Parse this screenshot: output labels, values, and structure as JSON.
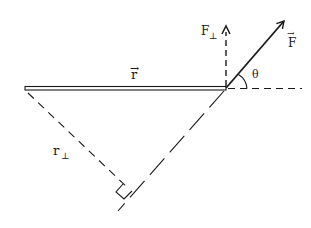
{
  "diagram": {
    "labels": {
      "r_vector": "r",
      "r_vector_arrow": "→",
      "r_perp": "r",
      "r_perp_sub": "⊥",
      "F_vector": "F",
      "F_vector_arrow": "→",
      "F_perp": "F",
      "F_perp_sub": "⊥",
      "theta": "θ"
    },
    "colors": {
      "ink": "#1a1a1a",
      "background": "#ffffff"
    },
    "geometry": {
      "rod": {
        "x1": 25,
        "y1": 88,
        "x2": 226,
        "y2": 88
      },
      "pivot": {
        "x": 226,
        "y": 88
      },
      "force_tip": {
        "x": 285,
        "y": 20
      },
      "f_perp_tip": {
        "x": 226,
        "y": 25
      },
      "line_of_action_end": {
        "x": 118,
        "y": 211
      },
      "r_perp_start": {
        "x": 28,
        "y": 93
      },
      "r_perp_foot": {
        "x": 131,
        "y": 190
      }
    }
  }
}
